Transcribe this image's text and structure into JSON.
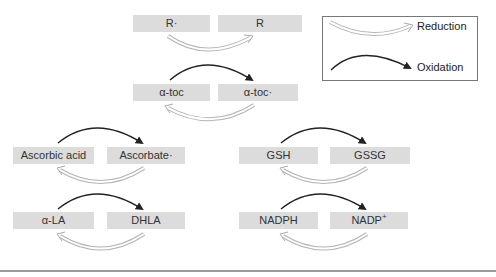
{
  "diagram": {
    "type": "redox-cycle",
    "nodes": [
      {
        "id": "r_radical",
        "label": "R·"
      },
      {
        "id": "r",
        "label": "R"
      },
      {
        "id": "atoc",
        "label": "α-toc"
      },
      {
        "id": "atoc_radical",
        "label": "α-toc·"
      },
      {
        "id": "ascorbic_acid",
        "label": "Ascorbic acid"
      },
      {
        "id": "ascorbate_radical",
        "label": "Ascorbate·"
      },
      {
        "id": "alpha_la",
        "label": "α-LA"
      },
      {
        "id": "dhla",
        "label": "DHLA"
      },
      {
        "id": "gsh",
        "label": "GSH"
      },
      {
        "id": "gssg",
        "label": "GSSG"
      },
      {
        "id": "nadph",
        "label": "NADPH"
      },
      {
        "id": "nadp_base",
        "label": "NADP",
        "sup": "+"
      }
    ],
    "edges": [
      {
        "from": "r_radical",
        "to": "r",
        "kind": "reduction"
      },
      {
        "from": "atoc",
        "to": "atoc_radical",
        "kind": "oxidation"
      },
      {
        "from": "atoc_radical",
        "to": "atoc",
        "kind": "reduction"
      },
      {
        "from": "ascorbic_acid",
        "to": "ascorbate_radical",
        "kind": "oxidation"
      },
      {
        "from": "ascorbate_radical",
        "to": "ascorbic_acid",
        "kind": "reduction"
      },
      {
        "from": "alpha_la",
        "to": "dhla",
        "kind": "oxidation"
      },
      {
        "from": "dhla",
        "to": "alpha_la",
        "kind": "reduction"
      },
      {
        "from": "gsh",
        "to": "gssg",
        "kind": "oxidation"
      },
      {
        "from": "gssg",
        "to": "gsh",
        "kind": "reduction"
      },
      {
        "from": "nadph",
        "to": "nadp_base",
        "kind": "oxidation"
      },
      {
        "from": "nadp_base",
        "to": "nadph",
        "kind": "reduction"
      }
    ]
  },
  "legend": {
    "reduction_label": "Reduction",
    "oxidation_label": "Oxidation"
  },
  "colors": {
    "node_fill": "#dcdcdc",
    "oxidation_arrow": "#222222",
    "reduction_arrow": "#b0b0b0"
  }
}
